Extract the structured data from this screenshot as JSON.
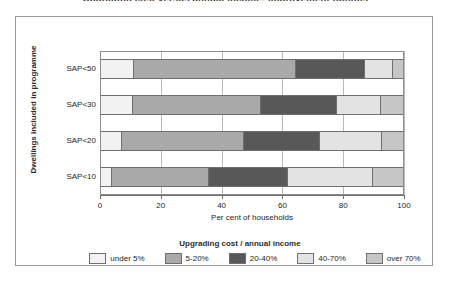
{
  "figure": {
    "title": "Upgrading cost versus annual income: improvement options"
  },
  "chart_data": {
    "type": "bar",
    "orientation": "horizontal",
    "stacked": true,
    "normalized": true,
    "title": "Upgrading cost versus annual income: improvement options",
    "xlabel": "Per cent of households",
    "ylabel": "Dwellings included in programme",
    "xlim": [
      0,
      100
    ],
    "xticks": [
      0,
      20,
      40,
      60,
      80,
      100
    ],
    "xtick_labels": [
      "0",
      "20",
      "40",
      "60",
      "80",
      "100"
    ],
    "grid": true,
    "grid_axis": "x",
    "legend_title": "Upgrading cost / annual income",
    "legend_position": "bottom",
    "categories": [
      "SAP<50",
      "SAP<30",
      "SAP<20",
      "SAP<10"
    ],
    "series": [
      {
        "name": "under 5%",
        "color": "#f2f2f2",
        "values": [
          11.0,
          10.5,
          7.0,
          3.5
        ]
      },
      {
        "name": "5-20%",
        "color": "#a9a9a9",
        "values": [
          53.0,
          42.0,
          40.0,
          32.0
        ]
      },
      {
        "name": "20-40%",
        "color": "#585858",
        "values": [
          23.0,
          25.0,
          25.0,
          26.0
        ]
      },
      {
        "name": "40-70%",
        "color": "#e3e3e3",
        "values": [
          9.0,
          14.5,
          20.5,
          28.0
        ]
      },
      {
        "name": "over 70%",
        "color": "#c6c6c6",
        "values": [
          4.0,
          8.0,
          7.5,
          10.5
        ]
      }
    ]
  },
  "colors": {
    "frame_border": "#9a9a9a",
    "plot_border": "#8d8d8d",
    "gridline": "#b9b9b9",
    "segment_border": "#6f6f6f",
    "text": "#1e1e1e",
    "background": "#ffffff"
  }
}
